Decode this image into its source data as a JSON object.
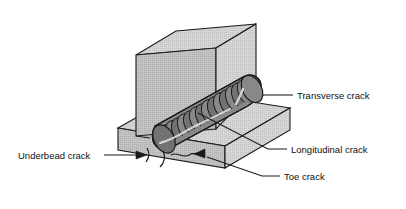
{
  "figure": {
    "type": "technical-illustration",
    "background_color": "#ffffff",
    "line_color": "#1a1a1a",
    "metal_fill_color": "#d2d2d2",
    "weld_bead_color": "#8a8a8a",
    "weld_bead_shadow_color": "#6e6e6e",
    "crack_line_color": "#ffffff"
  },
  "labels": [
    {
      "id": "transverse",
      "text": "Transverse crack",
      "x": 297,
      "y": 99,
      "anchor": "start",
      "leader": "M 293 95 L 266 95"
    },
    {
      "id": "longitudinal",
      "text": "Longitudinal crack",
      "x": 291,
      "y": 153,
      "anchor": "start",
      "leader": "M 287 149 L 268 149 L 196 114"
    },
    {
      "id": "toe",
      "text": "Toe crack",
      "x": 284,
      "y": 180,
      "anchor": "start",
      "leader": "M 280 176 L 262 176 L 205 157"
    },
    {
      "id": "underbead",
      "text": "Underbead crack",
      "x": 18,
      "y": 159,
      "anchor": "start",
      "leader": "M 104 155 L 136 155"
    }
  ],
  "parts": [
    {
      "id": "vertical-plate",
      "name": "Vertical plate"
    },
    {
      "id": "base-plate",
      "name": "Base plate"
    },
    {
      "id": "weld-bead",
      "name": "Weld bead"
    }
  ],
  "crack_markers": {
    "transverse": {
      "name": "transverse-crack-mark",
      "on": "weld-bead-ripple"
    },
    "longitudinal": {
      "name": "longitudinal-crack-mark",
      "on": "weld-bead-crown"
    },
    "underbead": {
      "name": "underbead-crack-arrow",
      "direction": "right"
    },
    "toe": {
      "name": "toe-crack-arrow",
      "direction": "left"
    }
  },
  "bead_ripple_count": 17
}
